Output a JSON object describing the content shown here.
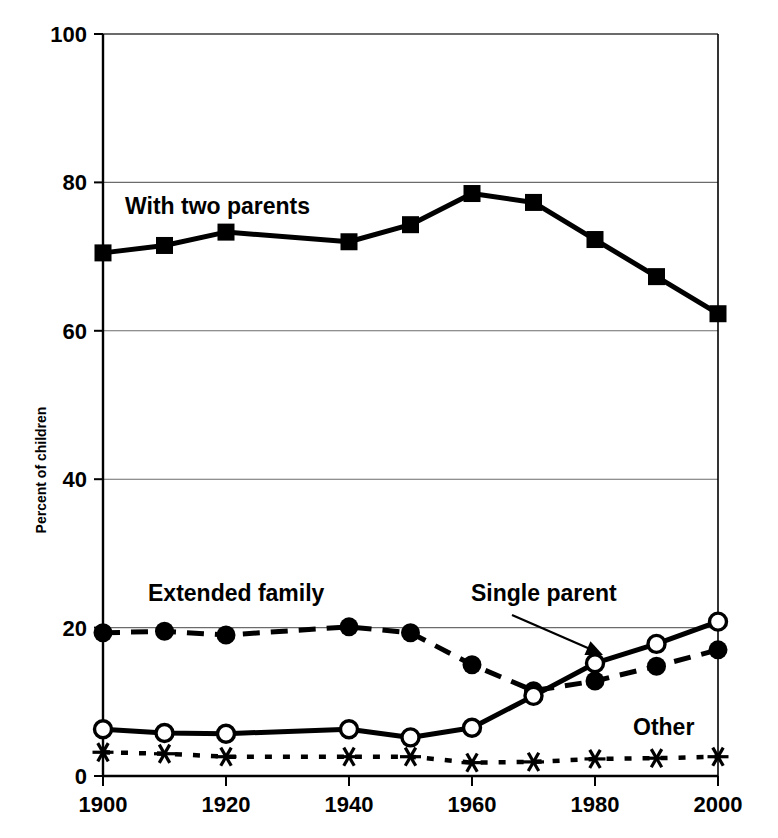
{
  "chart_data": {
    "type": "line",
    "title": "",
    "subtitle": "",
    "xlabel": "",
    "ylabel": "Percent of children",
    "xlim": [
      1900,
      2000
    ],
    "ylim": [
      0,
      100
    ],
    "yticks": [
      0,
      20,
      40,
      60,
      80,
      100
    ],
    "ytick_labels": [
      "0",
      "20",
      "40",
      "60",
      "80",
      "100"
    ],
    "xticks": [
      1900,
      1920,
      1940,
      1960,
      1980,
      2000
    ],
    "xtick_labels": [
      "1900",
      "1920",
      "1940",
      "1960",
      "1980",
      "2000"
    ],
    "x": [
      1900,
      1910,
      1920,
      1940,
      1950,
      1960,
      1970,
      1980,
      1990,
      2000
    ],
    "grid": "horizontal",
    "legend_position": "inline-annotations",
    "series": [
      {
        "name": "With two parents",
        "marker": "filled-square",
        "line_style": "solid",
        "x": [
          1900,
          1910,
          1920,
          1940,
          1950,
          1960,
          1970,
          1980,
          1990,
          2000
        ],
        "values": [
          70.5,
          71.5,
          73.3,
          72.0,
          74.3,
          78.5,
          77.3,
          72.3,
          67.3,
          62.3
        ]
      },
      {
        "name": "Extended family",
        "marker": "filled-circle",
        "line_style": "dashed",
        "x": [
          1900,
          1910,
          1920,
          1940,
          1950,
          1960,
          1970,
          1980,
          1990,
          2000
        ],
        "values": [
          19.3,
          19.5,
          19.0,
          20.1,
          19.3,
          15.0,
          11.5,
          12.8,
          14.8,
          17.0
        ]
      },
      {
        "name": "Single parent",
        "marker": "open-circle",
        "line_style": "solid",
        "x": [
          1900,
          1910,
          1920,
          1940,
          1950,
          1960,
          1970,
          1980,
          1990,
          2000
        ],
        "values": [
          6.3,
          5.8,
          5.7,
          6.3,
          5.2,
          6.5,
          10.8,
          15.2,
          17.8,
          20.8
        ]
      },
      {
        "name": "Other",
        "marker": "asterisk",
        "line_style": "dotted",
        "x": [
          1900,
          1910,
          1920,
          1940,
          1950,
          1960,
          1970,
          1980,
          1990,
          2000
        ],
        "values": [
          3.2,
          3.0,
          2.6,
          2.6,
          2.6,
          1.8,
          1.9,
          2.3,
          2.4,
          2.6
        ]
      }
    ],
    "annotations": [
      {
        "text": "With two parents",
        "x_px": 125,
        "y_px": 214,
        "anchor": "start"
      },
      {
        "text": "Extended family",
        "x_px": 148,
        "y_px": 601,
        "anchor": "start"
      },
      {
        "text": "Single parent",
        "x_px": 471,
        "y_px": 601,
        "anchor": "start"
      },
      {
        "text": "Other",
        "x_px": 633,
        "y_px": 735,
        "anchor": "start"
      }
    ],
    "arrow": {
      "from_x_px": 512,
      "from_y_px": 615,
      "to_x_px": 603,
      "to_y_px": 655
    }
  }
}
